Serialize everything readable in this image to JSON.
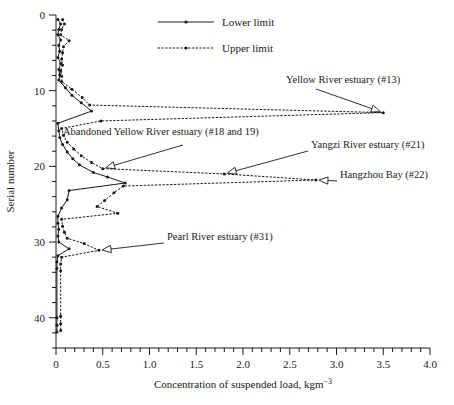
{
  "chart_data": {
    "type": "line",
    "title": "",
    "xlabel": "Concentration of suspended load, kgm",
    "xlabel_sup": "−3",
    "ylabel": "Serial number",
    "xlim": [
      0,
      4.0
    ],
    "ylim": [
      0,
      44
    ],
    "grid": false,
    "x_ticks": [
      "0",
      "0.5",
      "1.0",
      "1.5",
      "2.0",
      "2.5",
      "3.0",
      "3.5",
      "4.0"
    ],
    "x_tick_values": [
      0,
      0.5,
      1.0,
      1.5,
      2.0,
      2.5,
      3.0,
      3.5,
      4.0
    ],
    "x_minor_step": 0.1,
    "y_ticks": [
      "0",
      "10",
      "20",
      "30",
      "40"
    ],
    "y_tick_values": [
      0,
      10,
      20,
      30,
      40
    ],
    "y_minor_step": 2,
    "legend_position": "top-center",
    "series": [
      {
        "name": "Lower limit",
        "style": "solid",
        "points": [
          [
            0.02,
            0.6
          ],
          [
            0.05,
            1.2
          ],
          [
            0.03,
            1.9
          ],
          [
            0.02,
            2.6
          ],
          [
            0.05,
            3.3
          ],
          [
            0.03,
            4.0
          ],
          [
            0.04,
            4.8
          ],
          [
            0.02,
            5.6
          ],
          [
            0.05,
            6.4
          ],
          [
            0.03,
            7.2
          ],
          [
            0.04,
            7.9
          ],
          [
            0.03,
            8.6
          ],
          [
            0.1,
            9.6
          ],
          [
            0.17,
            10.6
          ],
          [
            0.27,
            11.6
          ],
          [
            0.38,
            12.7
          ],
          [
            0.02,
            14.3
          ],
          [
            0.03,
            15.3
          ],
          [
            0.04,
            16.2
          ],
          [
            0.07,
            17.1
          ],
          [
            0.12,
            18.1
          ],
          [
            0.18,
            19.0
          ],
          [
            0.25,
            19.8
          ],
          [
            0.4,
            20.8
          ],
          [
            0.55,
            21.4
          ],
          [
            0.74,
            22.2
          ],
          [
            0.14,
            23.2
          ],
          [
            0.12,
            24.4
          ],
          [
            0.06,
            25.5
          ],
          [
            0.02,
            26.6
          ],
          [
            0.02,
            27.5
          ],
          [
            0.03,
            28.3
          ],
          [
            0.02,
            29.2
          ],
          [
            0.03,
            30.0
          ],
          [
            0.14,
            30.9
          ],
          [
            0.02,
            31.8
          ],
          [
            0.01,
            32.6
          ],
          [
            0.01,
            33.5
          ],
          [
            0.01,
            40.0
          ],
          [
            0.01,
            41.0
          ],
          [
            0.01,
            41.9
          ]
        ]
      },
      {
        "name": "Upper limit",
        "style": "dotted",
        "points": [
          [
            0.07,
            0.6
          ],
          [
            0.09,
            1.2
          ],
          [
            0.06,
            1.9
          ],
          [
            0.05,
            2.6
          ],
          [
            0.14,
            3.4
          ],
          [
            0.08,
            4.2
          ],
          [
            0.07,
            5.0
          ],
          [
            0.06,
            5.8
          ],
          [
            0.07,
            6.6
          ],
          [
            0.05,
            7.4
          ],
          [
            0.06,
            8.1
          ],
          [
            0.06,
            8.8
          ],
          [
            0.17,
            9.8
          ],
          [
            0.28,
            10.9
          ],
          [
            0.36,
            11.9
          ],
          [
            3.5,
            12.9
          ],
          [
            0.48,
            14.0
          ],
          [
            0.06,
            15.0
          ],
          [
            0.08,
            15.9
          ],
          [
            0.12,
            16.8
          ],
          [
            0.19,
            17.7
          ],
          [
            0.27,
            18.6
          ],
          [
            0.38,
            19.5
          ],
          [
            0.5,
            20.3
          ],
          [
            1.8,
            21.0
          ],
          [
            2.78,
            21.8
          ],
          [
            0.72,
            22.6
          ],
          [
            0.62,
            23.5
          ],
          [
            0.52,
            24.5
          ],
          [
            0.44,
            25.3
          ],
          [
            0.66,
            26.2
          ],
          [
            0.06,
            27.0
          ],
          [
            0.07,
            27.9
          ],
          [
            0.09,
            28.7
          ],
          [
            0.12,
            29.5
          ],
          [
            0.3,
            30.2
          ],
          [
            0.46,
            31.1
          ],
          [
            0.06,
            32.0
          ],
          [
            0.05,
            32.9
          ],
          [
            0.05,
            33.8
          ],
          [
            0.05,
            39.8
          ],
          [
            0.05,
            40.8
          ],
          [
            0.05,
            41.7
          ]
        ]
      }
    ],
    "annotations": [
      {
        "id": "yellow-river",
        "label": "Yellow River estuary (#13)",
        "text_x": 286,
        "text_y": 83,
        "point": [
          3.5,
          12.9
        ]
      },
      {
        "id": "abandoned-yellow-river",
        "label": "Abandoned Yellow River estuary (#18 and 19)",
        "text_x": 63,
        "text_y": 135,
        "point": [
          0.5,
          20.3
        ]
      },
      {
        "id": "yangzi-river",
        "label": "Yangzi River estuary (#21)",
        "text_x": 311,
        "text_y": 148,
        "point": [
          1.8,
          21.0
        ]
      },
      {
        "id": "hangzhou-bay",
        "label": "Hangzhou Bay (#22)",
        "text_x": 340,
        "text_y": 178,
        "point": [
          2.78,
          21.8
        ]
      },
      {
        "id": "pearl-river",
        "label": "Pearl River estuary (#31)",
        "text_x": 167,
        "text_y": 240,
        "point": [
          0.46,
          31.1
        ]
      }
    ],
    "legend": [
      {
        "name": "Lower limit",
        "style": "solid"
      },
      {
        "name": "Upper limit",
        "style": "dotted"
      }
    ]
  }
}
